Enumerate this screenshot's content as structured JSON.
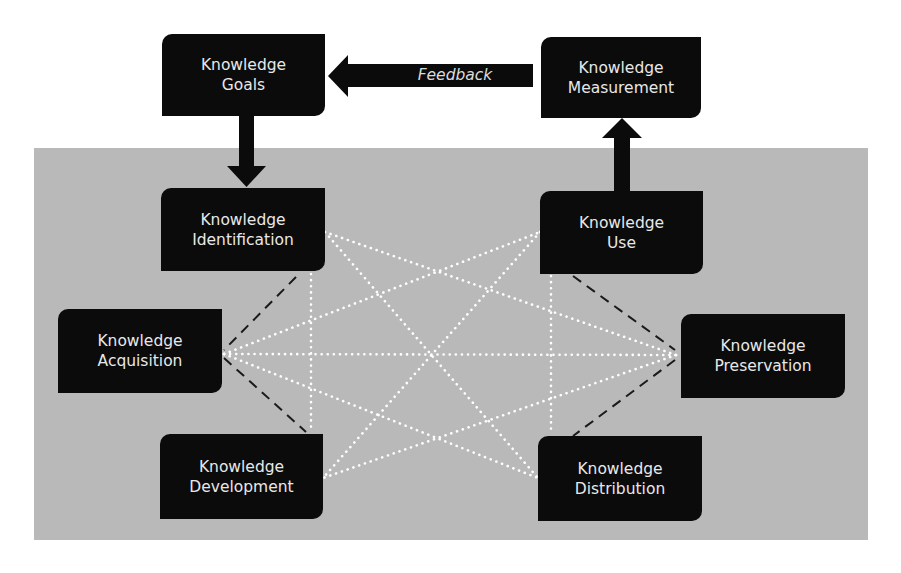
{
  "diagram": {
    "colors": {
      "box_fill": "#0b0b0b",
      "box_text": "#e8e8e8",
      "panel_bg": "#b9b9b9",
      "dotted_line": "#ffffff",
      "dashed_line": "#1a1a1a"
    },
    "feedback_label": "Feedback",
    "boxes": {
      "goals": {
        "line1": "Knowledge",
        "line2": "Goals"
      },
      "measurement": {
        "line1": "Knowledge",
        "line2": "Measurement"
      },
      "identification": {
        "line1": "Knowledge",
        "line2": "Identification"
      },
      "use": {
        "line1": "Knowledge",
        "line2": "Use"
      },
      "acquisition": {
        "line1": "Knowledge",
        "line2": "Acquisition"
      },
      "preservation": {
        "line1": "Knowledge",
        "line2": "Preservation"
      },
      "development": {
        "line1": "Knowledge",
        "line2": "Development"
      },
      "distribution": {
        "line1": "Knowledge",
        "line2": "Distribution"
      }
    },
    "edges": [
      {
        "from": "goals",
        "to": "identification",
        "style": "solid-arrow"
      },
      {
        "from": "use",
        "to": "measurement",
        "style": "solid-arrow"
      },
      {
        "from": "measurement",
        "to": "goals",
        "style": "solid-arrow",
        "label": "Feedback"
      },
      {
        "from": "identification",
        "to": "acquisition",
        "style": "dashed"
      },
      {
        "from": "acquisition",
        "to": "development",
        "style": "dashed"
      },
      {
        "from": "use",
        "to": "preservation",
        "style": "dashed"
      },
      {
        "from": "preservation",
        "to": "distribution",
        "style": "dashed"
      },
      {
        "from": "acquisition",
        "to": "preservation",
        "style": "dotted"
      },
      {
        "from": "acquisition",
        "to": "use",
        "style": "dotted"
      },
      {
        "from": "acquisition",
        "to": "distribution",
        "style": "dotted"
      },
      {
        "from": "preservation",
        "to": "identification",
        "style": "dotted"
      },
      {
        "from": "preservation",
        "to": "development",
        "style": "dotted"
      },
      {
        "from": "identification",
        "to": "distribution",
        "style": "dotted"
      },
      {
        "from": "use",
        "to": "development",
        "style": "dotted"
      },
      {
        "from": "identification",
        "to": "development",
        "style": "dotted"
      },
      {
        "from": "use",
        "to": "distribution",
        "style": "dotted"
      }
    ]
  }
}
